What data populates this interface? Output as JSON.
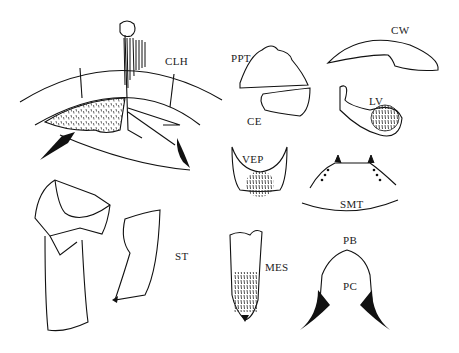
{
  "figure": {
    "type": "scientific line illustration (insect genitalia/morphology)",
    "labels": {
      "clh": "CLH",
      "ppt": "PPT",
      "ce": "CE",
      "cw": "CW",
      "lv": "LV",
      "vep": "VEP",
      "smt": "SMT",
      "st": "ST",
      "mes": "MES",
      "pb": "PB",
      "pc": "PC"
    },
    "colors": {
      "ink": "#111111",
      "background": "#ffffff"
    }
  }
}
